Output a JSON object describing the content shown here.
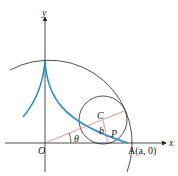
{
  "diagram": {
    "axes": {
      "x_label": "x",
      "y_label": "y"
    },
    "points": {
      "origin": "O",
      "center": "C",
      "point_p": "P",
      "point_a": "A(a, 0)"
    },
    "labels": {
      "angle": "θ",
      "radius": "b"
    },
    "colors": {
      "curve": "#2a8fc9",
      "radial_line": "#e07a7a",
      "stroke": "#222222"
    }
  }
}
